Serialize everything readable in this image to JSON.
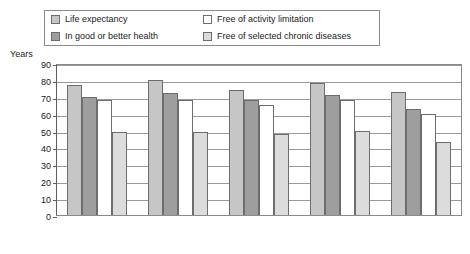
{
  "legend": {
    "items": [
      {
        "label": "Life expectancy",
        "color": "#c6c6c6"
      },
      {
        "label": "In good or better health",
        "color": "#9e9e9e"
      },
      {
        "label": "Free of activity limitation",
        "color": "#ffffff"
      },
      {
        "label": "Free of selected chronic diseases",
        "color": "#dcdcdc"
      }
    ]
  },
  "chart_data": {
    "type": "bar",
    "title": "",
    "xlabel": "",
    "ylabel": "Years",
    "ylim": [
      0,
      90
    ],
    "ytick_step": 10,
    "yticks": [
      0,
      10,
      20,
      30,
      40,
      50,
      60,
      70,
      80,
      90
    ],
    "grid": true,
    "legend_position": "top",
    "categories": [
      "Total",
      "Women",
      "Men",
      "White",
      "Black"
    ],
    "series": [
      {
        "name": "Life expectancy",
        "color": "#c6c6c6",
        "values": [
          77,
          80,
          74,
          78,
          73
        ]
      },
      {
        "name": "In good or better health",
        "color": "#9e9e9e",
        "values": [
          70,
          72,
          68,
          71,
          63
        ]
      },
      {
        "name": "Free of activity limitation",
        "color": "#ffffff",
        "values": [
          68,
          68,
          65,
          68,
          60
        ]
      },
      {
        "name": "Free of selected chronic diseases",
        "color": "#dcdcdc",
        "values": [
          49,
          49,
          48,
          50,
          43
        ]
      }
    ]
  }
}
